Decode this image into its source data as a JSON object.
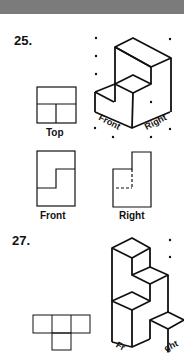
{
  "header": {
    "color": "#7b7b7b"
  },
  "problems": [
    {
      "number": "25.",
      "views": {
        "top": "Top",
        "front": "Front",
        "right": "Right"
      },
      "iso_labels": {
        "front": "Front",
        "right": "Right"
      }
    },
    {
      "number": "27.",
      "iso_labels": {
        "front": "Fr",
        "right": "ght"
      }
    }
  ],
  "colors": {
    "ink": "#111111",
    "background": "#ffffff"
  }
}
